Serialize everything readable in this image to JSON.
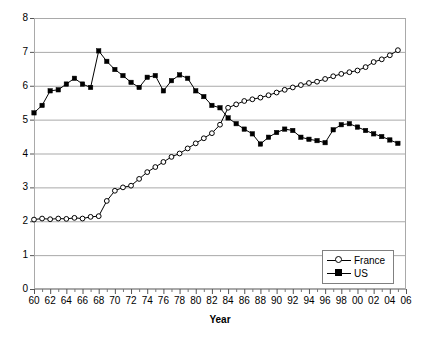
{
  "chart_data": {
    "type": "line",
    "title": "",
    "xlabel": "Year",
    "ylabel": "",
    "xlim": [
      1960,
      2006
    ],
    "ylim": [
      0,
      8
    ],
    "grid": "horizontal",
    "legend_position": "bottom-right",
    "ytick_labels": [
      "0",
      "1",
      "2",
      "3",
      "4",
      "5",
      "6",
      "7",
      "8"
    ],
    "ytick_values": [
      0,
      1,
      2,
      3,
      4,
      5,
      6,
      7,
      8
    ],
    "xtick_labels": [
      "60",
      "62",
      "64",
      "66",
      "68",
      "70",
      "72",
      "74",
      "76",
      "78",
      "80",
      "82",
      "84",
      "86",
      "88",
      "90",
      "92",
      "94",
      "96",
      "98",
      "00",
      "02",
      "04",
      "06"
    ],
    "xtick_values": [
      1960,
      1962,
      1964,
      1966,
      1968,
      1970,
      1972,
      1974,
      1976,
      1978,
      1980,
      1982,
      1984,
      1986,
      1988,
      1990,
      1992,
      1994,
      1996,
      1998,
      2000,
      2002,
      2004,
      2006
    ],
    "xtick_minor_values": [
      1961,
      1963,
      1965,
      1967,
      1969,
      1971,
      1973,
      1975,
      1977,
      1979,
      1981,
      1983,
      1985,
      1987,
      1989,
      1991,
      1993,
      1995,
      1997,
      1999,
      2001,
      2003,
      2005
    ],
    "x": [
      1960,
      1961,
      1962,
      1963,
      1964,
      1965,
      1966,
      1967,
      1968,
      1969,
      1970,
      1971,
      1972,
      1973,
      1974,
      1975,
      1976,
      1977,
      1978,
      1979,
      1980,
      1981,
      1982,
      1983,
      1984,
      1985,
      1986,
      1987,
      1988,
      1989,
      1990,
      1991,
      1992,
      1993,
      1994,
      1995,
      1996,
      1997,
      1998,
      1999,
      2000,
      2001,
      2002,
      2003,
      2004,
      2005
    ],
    "series": [
      {
        "name": "France",
        "marker": "open-circle",
        "color": "#000000",
        "values": [
          2.05,
          2.08,
          2.06,
          2.08,
          2.07,
          2.1,
          2.08,
          2.13,
          2.15,
          2.6,
          2.9,
          3.0,
          3.05,
          3.25,
          3.45,
          3.6,
          3.75,
          3.9,
          4.0,
          4.15,
          4.3,
          4.45,
          4.6,
          4.85,
          5.35,
          5.45,
          5.55,
          5.6,
          5.65,
          5.72,
          5.8,
          5.88,
          5.95,
          6.02,
          6.08,
          6.12,
          6.2,
          6.28,
          6.35,
          6.4,
          6.45,
          6.55,
          6.7,
          6.78,
          6.9,
          7.05
        ]
      },
      {
        "name": "US",
        "marker": "filled-square",
        "color": "#000000",
        "values": [
          5.2,
          5.42,
          5.85,
          5.88,
          6.05,
          6.22,
          6.05,
          5.95,
          7.03,
          6.72,
          6.48,
          6.3,
          6.1,
          5.95,
          6.25,
          6.3,
          5.85,
          6.15,
          6.32,
          6.22,
          5.85,
          5.68,
          5.42,
          5.35,
          5.05,
          4.88,
          4.72,
          4.58,
          4.28,
          4.48,
          4.62,
          4.72,
          4.68,
          4.48,
          4.42,
          4.38,
          4.32,
          4.7,
          4.85,
          4.88,
          4.78,
          4.68,
          4.58,
          4.5,
          4.4,
          4.3
        ]
      }
    ]
  },
  "axis": {
    "x_title": "Year"
  },
  "legend": {
    "items": [
      {
        "label": "France",
        "marker": "open-circle"
      },
      {
        "label": "US",
        "marker": "filled-square"
      }
    ]
  }
}
